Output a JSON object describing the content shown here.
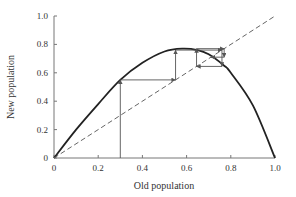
{
  "chart_data": {
    "type": "line",
    "title": "",
    "xlabel": "Old population",
    "ylabel": "New population",
    "xlim": [
      0,
      1.0
    ],
    "ylim": [
      0,
      1.0
    ],
    "grid": false,
    "xticks": [
      "0",
      "0.2",
      "0.4",
      "0.6",
      "0.8",
      "1.0"
    ],
    "yticks": [
      "0",
      "0.2",
      "0.4",
      "0.6",
      "0.8",
      "1.0"
    ],
    "series": [
      {
        "name": "population map curve",
        "style": "solid",
        "color": "#222222",
        "x": [
          0,
          0.1,
          0.2,
          0.3,
          0.4,
          0.5,
          0.58,
          0.65,
          0.7,
          0.77,
          0.8,
          0.9,
          1.0
        ],
        "y": [
          0,
          0.2,
          0.38,
          0.55,
          0.67,
          0.75,
          0.77,
          0.76,
          0.73,
          0.65,
          0.6,
          0.37,
          0
        ]
      },
      {
        "name": "identity line y = x",
        "style": "dashed",
        "color": "#666666",
        "x": [
          0,
          1.0
        ],
        "y": [
          0,
          1.0
        ]
      },
      {
        "name": "cobweb iteration",
        "style": "arrows",
        "color": "#555555",
        "x": [
          0.3,
          0.3,
          0.55,
          0.55,
          0.76,
          0.76,
          0.645,
          0.645,
          0.77,
          0.77,
          0.71
        ],
        "y": [
          0,
          0.55,
          0.55,
          0.76,
          0.76,
          0.645,
          0.645,
          0.77,
          0.77,
          0.71,
          0.71
        ]
      }
    ],
    "legend": null
  }
}
